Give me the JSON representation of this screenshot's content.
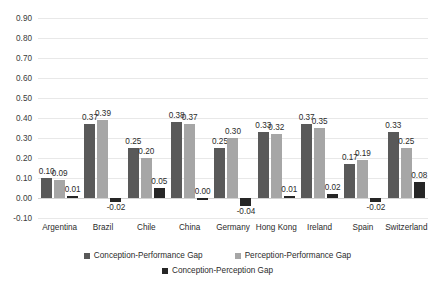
{
  "chart_data": {
    "type": "bar",
    "title": "",
    "subtitle": "",
    "xlabel": "",
    "ylabel": "",
    "ylim": [
      -0.1,
      0.9
    ],
    "ytick_step": 0.1,
    "ytick_labels": [
      "0.90",
      "0.80",
      "0.70",
      "0.60",
      "0.50",
      "0.40",
      "0.30",
      "0.20",
      "0.10",
      "0.00",
      "-0.10"
    ],
    "ytick_values": [
      0.9,
      0.8,
      0.7,
      0.6,
      0.5,
      0.4,
      0.3,
      0.2,
      0.1,
      0.0,
      -0.1
    ],
    "grid": true,
    "grid_axis": "y",
    "legend_position": "bottom",
    "categories": [
      "Argentina",
      "Brazil",
      "Chile",
      "China",
      "Germany",
      "Hong Kong",
      "Ireland",
      "Spain",
      "Switzerland"
    ],
    "series": [
      {
        "name": "Conception-Performance Gap",
        "color": "#595959",
        "values": [
          0.1,
          0.37,
          0.25,
          0.38,
          0.25,
          0.33,
          0.37,
          0.17,
          0.33
        ],
        "labels": [
          "0.10",
          "0.37",
          "0.25",
          "0.38",
          "0.25",
          "0.33",
          "0.37",
          "0.17",
          "0.33"
        ]
      },
      {
        "name": "Perception-Performance Gap",
        "color": "#a6a6a6",
        "values": [
          0.09,
          0.39,
          0.2,
          0.37,
          0.3,
          0.32,
          0.35,
          0.19,
          0.25
        ],
        "labels": [
          "0.09",
          "0.39",
          "0.20",
          "0.37",
          "0.30",
          "0.32",
          "0.35",
          "0.19",
          "0.25"
        ]
      },
      {
        "name": "Conception-Perception Gap",
        "color": "#262626",
        "values": [
          0.01,
          -0.02,
          0.05,
          0.0,
          -0.04,
          0.01,
          0.02,
          -0.02,
          0.08
        ],
        "labels": [
          "0.01",
          "-0.02",
          "0.05",
          "0.00",
          "-0.04",
          "0.01",
          "0.02",
          "-0.02",
          "0.08"
        ]
      }
    ]
  },
  "legend": {
    "row1": [
      {
        "label": "Conception-Performance Gap",
        "color": "#595959"
      },
      {
        "label": "Perception-Performance Gap",
        "color": "#a6a6a6"
      }
    ],
    "row2": [
      {
        "label": "Conception-Perception Gap",
        "color": "#262626"
      }
    ]
  }
}
